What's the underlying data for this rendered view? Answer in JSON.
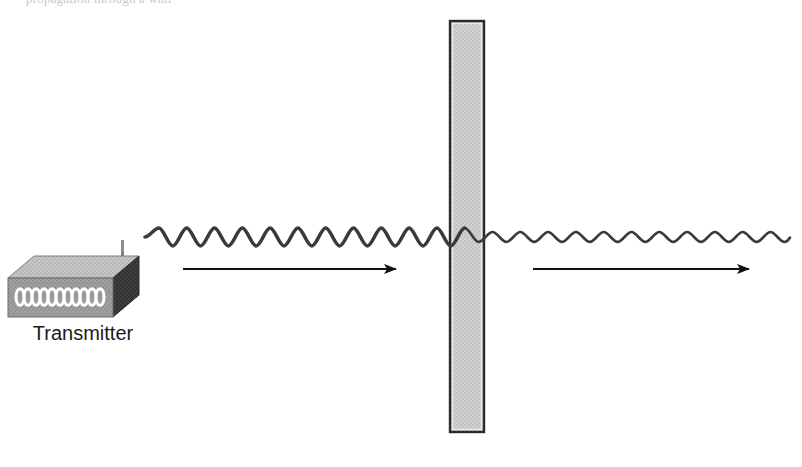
{
  "diagram": {
    "title_partial": "propagation through a wall",
    "transmitter": {
      "label": "Transmitter",
      "antenna": "antenna-icon",
      "front_face_color": "#9a9a9a",
      "top_face_color": "#c4c4c4",
      "side_face_color": "#3a3a3a",
      "wave_glyph_color": "#ffffff",
      "loop_count": 6
    },
    "wall": {
      "label": "",
      "fill_color": "#cfcfcf",
      "border_color": "#2b2b2b",
      "x": 450,
      "y": 21,
      "width": 34,
      "height": 411
    },
    "wave_incident": {
      "name": "incident-wave",
      "color": "#3a3a3a",
      "amplitude": 9,
      "wavelength": 37,
      "stroke_width": 3.6,
      "x_start": 145,
      "x_end": 452
    },
    "wave_transmitted": {
      "name": "transmitted-wave",
      "color": "#3a3a3a",
      "amplitude": 5,
      "wavelength": 37,
      "stroke_width": 2.6,
      "x_start": 482,
      "x_end": 790
    },
    "arrow_left": {
      "name": "direction-arrow-incident",
      "color": "#111111",
      "x_start": 183,
      "x_end": 396,
      "y": 269
    },
    "arrow_right": {
      "name": "direction-arrow-transmitted",
      "color": "#111111",
      "x_start": 533,
      "x_end": 749,
      "y": 269
    },
    "baseline_y": 237
  }
}
